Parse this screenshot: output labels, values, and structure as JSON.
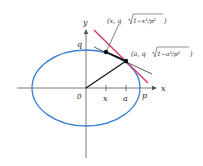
{
  "diagram": {
    "axes": {
      "x_label": "x",
      "y_label": "y",
      "origin_label": "0"
    },
    "ellipse": {
      "semi_major_label": "p",
      "semi_minor_label": "q",
      "color": "#3a7fcf"
    },
    "ticks": {
      "x_tick_label": "x",
      "a_tick_label": "a"
    },
    "points": {
      "point_x_label": "(x, q√(1−x²/p²))",
      "point_x_prefix": "(x, q",
      "point_x_radicand": "1−x²/p²",
      "point_x_suffix": ")",
      "point_a_label": "(a, q√(1−a²/p²))",
      "point_a_prefix": "(a, q",
      "point_a_radicand": "1−a²/p²",
      "point_a_suffix": ")"
    },
    "colors": {
      "tangent_line": "#d6336c",
      "secant_line": "#333333",
      "radius_line": "#111111",
      "axes": "#555555"
    }
  }
}
